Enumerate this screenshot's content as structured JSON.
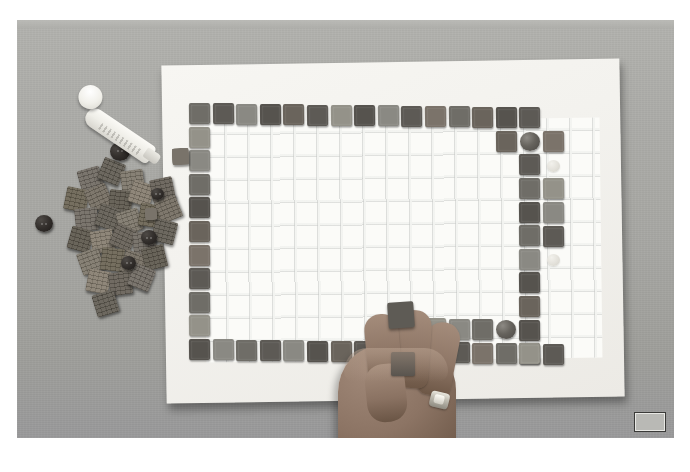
{
  "scene": {
    "title": "Mosaic tile craft in progress",
    "description": "Overhead photograph of a hand placing square mosaic tiles along the border of a white gridded mosaic base board resting on a gray table",
    "photo": {
      "width_px": 657,
      "height_px": 418,
      "offset_x_px": 17,
      "offset_y_px": 20,
      "border_color": "#ffffff"
    },
    "colors": {
      "table_surface": "#a9a9a5",
      "paper_white": "#f5f4f0",
      "grid_line": "#c4c6c4",
      "tile_dark": "#5d5a55",
      "tile_dark_alt": "#56534e",
      "tile_mid": "#6f6d67",
      "tile_light": "#8a8983",
      "tile_light_alt": "#949289",
      "tile_warm": "#6a645c",
      "tile_warm_alt": "#7b736a",
      "skin": "#8f7767",
      "button_dark": "#2b2724",
      "glue_white": "#f4f3ee",
      "badge_gray": "#b9b9b5"
    }
  },
  "board": {
    "name": "mosaic-base-board",
    "grid_cols": 18,
    "grid_rows": 11,
    "cell_size_px": 21,
    "tiles_placed_note": "Border of tiles partially completed; interior left empty"
  },
  "objects": [
    {
      "name": "glue-tube",
      "label": "Glue tube with round cap",
      "count": 1
    },
    {
      "name": "hand",
      "label": "Hand holding a mosaic tile",
      "count": 1
    },
    {
      "name": "ring",
      "label": "Ring on finger",
      "count": 1
    },
    {
      "name": "loose-tile-pile",
      "label": "Pile of loose mosaic tiles",
      "count": 26
    },
    {
      "name": "dark-button",
      "label": "Dark round buttons",
      "count": 5
    },
    {
      "name": "glass-disc",
      "label": "Round glass disc tiles on board",
      "count": 2
    },
    {
      "name": "pale-disc",
      "label": "Pale round marker discs",
      "count": 3
    },
    {
      "name": "flower-shape",
      "label": "Flower-shaped craft pieces",
      "count": 2
    },
    {
      "name": "corner-badge",
      "label": "Gray rectangular corner marker",
      "count": 1
    }
  ],
  "tile_rows": {
    "top_row_count": 15,
    "bottom_row_count": 15,
    "left_column_count": 9,
    "right_column_count": 9
  },
  "badge": {
    "name": "corner-badge",
    "text": ""
  }
}
